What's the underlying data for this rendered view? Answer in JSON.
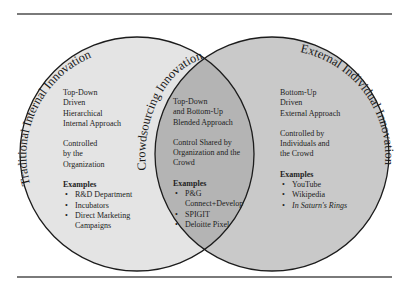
{
  "diagram": {
    "type": "venn",
    "colors": {
      "left_fill": "#e4e4e4",
      "right_fill": "#c9c9c9",
      "overlap_fill": "#b4b4b4",
      "outline": "#1c1c1c",
      "rule": "#7a7a7a"
    },
    "left": {
      "title": "Traditional Internal Innovation",
      "approach": [
        "Top-Down",
        "Driven",
        "Hierarchical",
        "Internal Approach"
      ],
      "control": [
        "Controlled",
        "by the",
        "Organization"
      ],
      "examples_title": "Examples",
      "examples": [
        "R&D Department",
        "Incubators",
        "Direct Marketing",
        "Campaigns"
      ]
    },
    "overlap": {
      "title": "Crowdsourcing Innovation",
      "approach": [
        "Top-Down",
        "and Bottom-Up",
        "Blended Approach"
      ],
      "control": [
        "Control Shared by",
        "Organization and the",
        "Crowd"
      ],
      "examples_title": "Examples",
      "examples": [
        "P&G",
        "Connect+Develop",
        "SPIGIT",
        "Deloitte Pixel"
      ]
    },
    "right": {
      "title": "External Individual Innovation",
      "approach": [
        "Bottom-Up",
        "Driven",
        "External Approach"
      ],
      "control": [
        "Controlled by",
        "Individuals and",
        "the Crowd"
      ],
      "examples_title": "Examples",
      "examples": [
        "YouTube",
        "Wikipedia",
        "In Saturn's Rings"
      ]
    }
  }
}
